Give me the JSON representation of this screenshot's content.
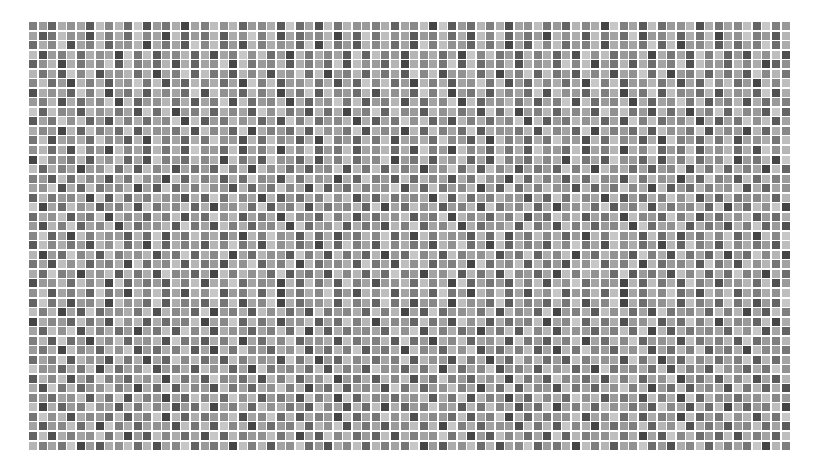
{
  "grid": {
    "cols": 80,
    "rows": 45,
    "pitch_x": 9.525,
    "pitch_y": 9.533,
    "cell_size": 8,
    "background": "#ffffff",
    "palette": [
      "#3a3a3a",
      "#454545",
      "#505050",
      "#5a5a5a",
      "#646464",
      "#6d6d6d",
      "#767676",
      "#7f7f7f",
      "#888888",
      "#919191",
      "#9a9a9a",
      "#a3a3a3",
      "#acacac",
      "#b5b5b5",
      "#bebebe",
      "#c7c7c7"
    ],
    "encoding": "each row string: one hex digit per cell indexing palette",
    "rows_data": [
      "7a4c9b3e8d5f2a6c1b7e9d4a8c3f5b2e6d9a7c4b8e1f3a5d7c2b9e6a4d8c1f7b3e5a9d2c6b8e4f",
      "b36e9a2d7c5f8b1e4a6d3c9f7e2b5a8d1c4f6e9b3a7d5c2e8f4b6a1d9c3e7b5f2a8d4c6e1b9f7a3d",
      "5c8f2b7e4a9d1c6b3f8e5a2d7c9b4f1e6a3d8c5b2f7e9a4d6c1b3f8e5a7d2c9b6f4e1a8d3c5b7f",
      "e2a7d5c9b1f6e3a8d4c2b7f9e5a1d6c8b3f4e7a2d9c5b1f8e6a3d7c4b2f9e5a8d1c6b3f7e4a2d9",
      "49d1c6b8f3e7a5d2c4b9f1e6a8d3c7b5f2e9a4d1c8b6f3e5a7d2c9b4f8e1a6d3c5b7f2e9a4d8c1",
      "d6b3f8e2a9d5c1b7f4e6a3d8c2b9f5e1a7d4c6b3f8e2a9d5c1b7f4e6a3d8c2b9f5e1a7d4c6b3f8",
      "8e5a1d7c3b9f6e2a4d8c5b1f7e3a9d6c2b4f8e5a1d7c3b9f6e2a4d8c5b1f7e3a9d6c2b4f8e5a1d",
      "2c9b4f7e1a6d3c8b5f2e9a4d7c1b6f3e8a5d2c9b4f7e1a6d3c8b5f2e9a4d7c1b6f3e8a5d2c9b4f",
      "a7d2c5b8f1e4a9d6c3b7f2e5a8d1c4b9f6e3a7d2c5b8f1e4a9d6c3b7f2e5a8d1c4b9f6e3a7d2c5",
      "f4e8a3d9c6b2f5e1a7d4c8b3f9e6a2d5c1b7f4e8a3d9c6b2f5e1a7d4c8b3f9e6a2d5c1b7f4e8a3",
      "3b6f9e4a2d7c5b8f1e3a6d9c4b2f7e5a8d1c3b6f9e4a2d7c5b8f1e3a6d9c4b2f7e5a8d1c3b6f9e",
      "c8a1d4e7b5f3c9a6d2e8b4f1c7a5d3e9b6f2c8a1d4e7b5f3c9a6d2e8b4f1c7a5d3e9b6f2c8a1d4",
      "6e2b9c5f8a3d1e7b4c6f9a2d5e8b3c1f7a4d6e2b9c5f8a3d1e7b4c6f9a2d5e8b3c1f7a4d6e2b9c",
      "9d5c2f7a1e8b4d6c3f9a5e2b7d1c8f4a6e3b9d5c2f7a1e8b4d6c3f9a5e2b7d1c8f4a6e3b9d5c2f",
      "1f8a6d3c9e4b2f7a5d8c1e6b3f9a4d2c7e5b8f1a6d3c9e4b2f7a5d8c1e6b3f9a4d2c7e5b8f1a6d",
      "e4c7b1a9f5d3e8c2b6a4f7d1e9c5b3a8f2d6e4c7b1a9f5d3e8c2b6a4f7d1e9c5b3a8f2d6e4c7b1",
      "7a3e5d8b2c6f9a1e4d7b3c5f8a2e6d9b1c4f7a3e5d8b2c6f9a1e4d7b3c5f8a2e6d9b1c4f7a3e5d",
      "b9f2c4e6a8d1b3f5c7e9a2d4b6f8c1e3a5d7b9f2c4e6a8d1b3f5c7e9a2d4b6f8c1e3a5d7b9f2c4",
      "4d6a8c1f3e5b7d9a2c4f6e8b1d3a5c7f9e2b4d6a8c1f3e5b7d9a2c4f6e8b1d3a5c7f9e2b4d6a8c",
      "f1b5e9c3a7d2f6b8e4c1a9d5f3b7e2c6a8d4f1b5e9c3a7d2f6b8e4c1a9d5f3b7e2c6a8d4f1b5e9",
      "5c9e3a6f1d8b4c7e2a5f9d3b6c1e8a4f7d2b5c9e3a6f1d8b4c7e2a5f9d3b6c1e8a4f7d2b5c9e3a",
      "a2d7f4b8e1c5a9d3f6b2e7c4a8d1f5b9e3c6a2d7f4b8e1c5a9d3f6b2e7c4a8d1f5b9e3c6a2d7f4",
      "8f4b1e7c9a3d5f2b6e8c4a1d7f9b3e5c2a6d8f4b1e7c9a3d5f2b6e8c4a1d7f9b3e5c2a6d8f4b1e",
      "3e8c6a2d9f5b1e4c7a3d8f6b2e9c5a1d4f7b3e8c6a2d9f5b1e4c7a3d8f6b2e9c5a1d4f7b3e8c6a",
      "d1a5f8c3e7b9d2a6f4c8e1b5d9a3f7c2e6b4d1a5f8c3e7b9d2a6f4c8e1b5d9a3f7c2e6b4d1a5f8",
      "6b2e9d4a7c1f5b8e3d6a2c9f4b7e1d5a8c3f6b2e9d4a7c1f5b8e3d6a2c9f4b7e1d5a8c3f6b2e9d",
      "c5f7a1b9e3d6c2f8a4b1e7d9c5f3a6b2e8d4c5f7a1b9e3d6c2f8a4b1e7d9c5f3a6b2e8d4c5f7a1",
      "2a9d5e8c1f4b6a3d7e2c9f5b8a1d4e6c3f7b2a9d5e8c1f4b6a3d7e2c9f5b8a1d4e6c3f7b2a9d5e",
      "9e3b7c4f6a1d8e5b2c9f3a7d4e1b6c8f5a2d9e3b7c4f6a1d8e5b2c9f3a7d4e1b6c8f5a2d9e3b7c",
      "4f6c2a8d1e9b5f3c7a4d6e2b8f1c5a9d3e7b4f6c2a8d1e9b5f3c7a4d6e2b8f1c5a9d3e7b4f6c2a",
      "e7d1b3f5a9c6e2d8b4f1a7c3e9d5b2f6a8c4e7d1b3f5a9c6e2d8b4f1a7c3e9d5b2f6a8c4e7d1b3",
      "1c8a4e6b2f9d3c5a7e1b8f4d6c2a9e3b5f7d1c8a4e6b2f9d3c5a7e1b8f4d6c2a9e3b5f7d1c8a4e",
      "b4e9f2d7c5a1b6e3f8d2c9a4b7e5f1d3c6a8b4e9f2d7c5a1b6e3f8d2c9a4b7e5f1d3c6a8b4e9f2",
      "7d3f5a1c8e4b9d2f6a3c7e1b5d8f4a9c2e6b7d3f5a1c8e4b9d2f6a3c7e1b5d8f4a9c2e6b7d3f5a",
      "a6c1e8b4d9f2a5c7e3b1d6f8a4c9e2b5d7f3a6c1e8b4d9f2a5c7e3b1d6f8a4c9e2b5d7f3a6c1e8",
      "5b7f3d9a2e6c1b4f8d5a3e7c9b2f6d1a4e8c5b7f3d9a2e6c1b4f8d5a3e7c9b2f6d1a4e8c5b7f3d",
      "f9a4c6e1d5b8f2a7c3e9d4b1f6a8c5e2d7b3f9a4c6e1d5b8f2a7c3e9d4b1f6a8c5e2d7b3f9a4c6",
      "3d8e2b5f7a4c9d1e6b3f8a5c2d7e4b9f1a6c3d8e2b5f7a4c9d1e6b3f8a5c2d7e4b9f1a6c3d8e2b",
      "c2f6d4a9e7b1c5f3d8a2e6b4c9f7d1a5e3b8c2f6d4a9e7b1c5f3d8a2e6b4c9f7d1a5e3b8c2f6d4",
      "8a5b9e3c6f2d7a1b4e8c5f9d3a6b2e7c1f4d8a5b9e3c6f2d7a1b4e8c5f9d3a6b2e7c1f4d8a5b9e",
      "e1c4a7f9b3d6e8c2a5f1b7d4e9c6a3f8b2d5e1c4a7f9b3d6e8c2a5f1b7d4e9c6a3f8b2d5e1c4a7",
      "6f9d2c8a5e3b7f1d4c6a9e2b8f5d3c7a1e4b6f9d2c8a5e3b7f1d4c6a9e2b8f5d3c7a1e4b6f9d2c",
      "b3a8e5d1f7c4b9a2e6d3f8c1b5a7e4d9f2c6b3a8e5d1f7c4b9a2e6d3f8c1b5a7e4d9f2c6b3a8e5",
      "4e2c7b9f6d1a3e8c5b2f4d7a9e6c1b3f8d5a4e2c7b9f6d1a3e8c5b2f4d7a9e6c1b3f8d5a4e2c7b",
      "d7b6f1a3c9e5d2b8f4a6c1e7d3b9f5a2c8e4d7b6f1a3c9e5d2b8f4a6c1e7d3b9f5a2c8e4d7b6f1"
    ]
  }
}
